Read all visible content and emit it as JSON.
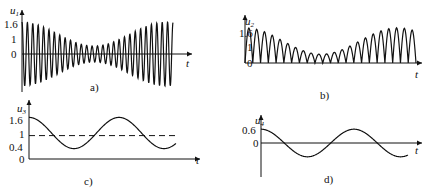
{
  "panels": [
    {
      "id": "a",
      "caption": "a)",
      "ylabel_var": "u",
      "ylabel_sub": "1",
      "xlabel": "t",
      "yticks": [
        "1.6",
        "1",
        "0"
      ],
      "description": "Amplitude-modulated high-frequency oscillation (beat), envelope max ~1.6, min ~0.2"
    },
    {
      "id": "b",
      "caption": "b)",
      "ylabel_var": "u",
      "ylabel_sub": "2",
      "xlabel": "t",
      "yticks": [
        "1.6",
        "1",
        "0"
      ],
      "description": "Rectified version of a): positive half-wave humps following the envelope"
    },
    {
      "id": "c",
      "caption": "c)",
      "ylabel_var": "u",
      "ylabel_sub": "3",
      "xlabel": "t",
      "yticks": [
        "1.6",
        "1",
        "0.4",
        "0"
      ],
      "description": "Low-frequency envelope oscillating between 0.4 and 1.6, dashed DC line near 1"
    },
    {
      "id": "d",
      "caption": "d)",
      "ylabel_var": "u",
      "ylabel_sub": "4",
      "xlabel": "t",
      "yticks": [
        "0.6",
        "0"
      ],
      "description": "DC removed: cosine with amplitude 0.6 centered at 0"
    }
  ],
  "chart_data": [
    {
      "type": "line",
      "title": "a)",
      "ylabel": "u1",
      "xlabel": "t",
      "yticks": [
        0,
        1,
        1.6
      ],
      "envelope": {
        "dc": 1.0,
        "amplitude": 0.6
      },
      "carrier_cycles": 28
    },
    {
      "type": "line",
      "title": "b)",
      "ylabel": "u2",
      "xlabel": "t",
      "yticks": [
        0,
        1,
        1.6
      ],
      "humps": 22
    },
    {
      "type": "line",
      "title": "c)",
      "ylabel": "u3",
      "xlabel": "t",
      "yticks": [
        0,
        0.4,
        1,
        1.6
      ],
      "min": 0.4,
      "max": 1.6,
      "dashed_level": 0.9
    },
    {
      "type": "line",
      "title": "d)",
      "ylabel": "u4",
      "xlabel": "t",
      "yticks": [
        0,
        0.6
      ],
      "amplitude": 0.6
    }
  ]
}
